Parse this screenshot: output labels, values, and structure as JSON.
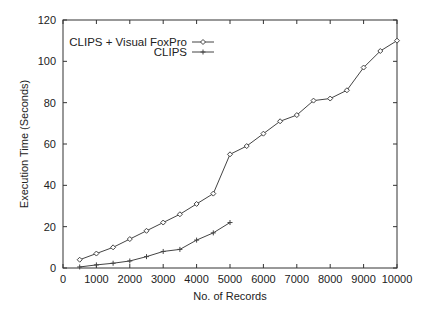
{
  "chart_data": {
    "type": "line",
    "title": "",
    "xlabel": "No. of Records",
    "ylabel": "Execution Time (Seconds)",
    "xlim": [
      0,
      10000
    ],
    "ylim": [
      0,
      120
    ],
    "xticks": [
      0,
      1000,
      2000,
      3000,
      4000,
      5000,
      6000,
      7000,
      8000,
      9000,
      10000
    ],
    "yticks": [
      0,
      20,
      40,
      60,
      80,
      100,
      120
    ],
    "grid": false,
    "legend_position": "top-left (inside)",
    "series": [
      {
        "name": "CLIPS + Visual FoxPro",
        "marker": "diamond",
        "x": [
          500,
          1000,
          1500,
          2000,
          2500,
          3000,
          3500,
          4000,
          4500,
          5000,
          5500,
          6000,
          6500,
          7000,
          7500,
          8000,
          8500,
          9000,
          9500,
          10000
        ],
        "values": [
          4,
          7,
          10,
          14,
          18,
          22,
          26,
          31,
          36,
          55,
          59,
          65,
          71,
          74,
          81,
          82,
          86,
          97,
          105,
          110
        ]
      },
      {
        "name": "CLIPS",
        "marker": "plus",
        "x": [
          500,
          1000,
          1500,
          2000,
          2500,
          3000,
          3500,
          4000,
          4500,
          5000
        ],
        "values": [
          0.5,
          1.5,
          2.3,
          3.4,
          5.5,
          8,
          9,
          13.5,
          17,
          22
        ]
      }
    ]
  },
  "colors": {
    "axis": "#333333",
    "line": "#444444",
    "text": "#222222",
    "background": "#ffffff"
  }
}
